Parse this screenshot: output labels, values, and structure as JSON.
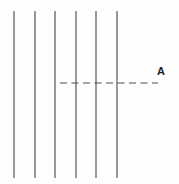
{
  "figure": {
    "background_color": "#fefefe",
    "line_color": "#4f4f4f",
    "label_color": "#1d1d1d",
    "ray_label": "A",
    "ray_label_name": "ray-direction-label-A",
    "wavefronts": [
      {
        "name": "wavefront-1",
        "x": 14,
        "y_top": 11,
        "y_bottom": 178
      },
      {
        "name": "wavefront-2",
        "x": 35,
        "y_top": 11,
        "y_bottom": 178
      },
      {
        "name": "wavefront-3",
        "x": 55,
        "y_top": 11,
        "y_bottom": 178
      },
      {
        "name": "wavefront-4",
        "x": 76,
        "y_top": 11,
        "y_bottom": 178
      },
      {
        "name": "wavefront-5",
        "x": 96,
        "y_top": 11,
        "y_bottom": 178
      },
      {
        "name": "wavefront-6",
        "x": 117,
        "y_top": 11,
        "y_bottom": 178
      }
    ],
    "ray": {
      "name": "ray-dashed-line",
      "x_start": 60,
      "x_end": 158,
      "y": 83,
      "dash_pattern": "7 4.5"
    },
    "label_position": {
      "x": 157,
      "y": 66
    }
  }
}
